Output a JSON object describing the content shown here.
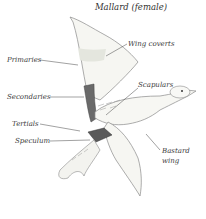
{
  "title": "Mallard (female)",
  "labels": {
    "wing_coverts": "Wing coverts",
    "primaries": "Primaries",
    "secondaries": "Secondaries",
    "scapulars": "Scapulars",
    "tertials": "Tertials",
    "speculum": "Speculum",
    "bastard_wing_line1": "Bastard",
    "bastard_wing_line2": "wing"
  },
  "colors": {
    "ink": "#3a3a3a",
    "speculum": "#5a5a5a",
    "wash": "#e8e8e2"
  }
}
